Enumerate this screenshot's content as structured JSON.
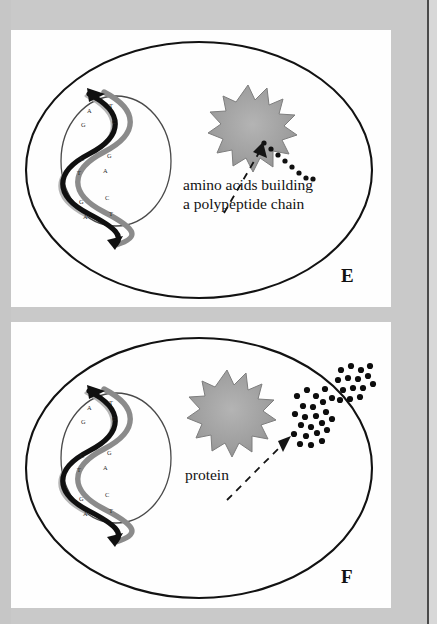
{
  "figure": {
    "background_color": "#c9c9c9",
    "panel_background": "#fefefe",
    "ink_color": "#111111",
    "ribosome_color": "#9a9a9a",
    "page_edge_color": "#4a4a4a"
  },
  "panels": [
    {
      "id": "E",
      "letter": "E",
      "caption_line1": "amino acids building",
      "caption_line2": "a polypeptide chain",
      "cell": {
        "label": "cell membrane"
      },
      "nucleus": {
        "label": "nucleus"
      },
      "dna": {
        "label": "DNA double helix",
        "base_pairs": [
          {
            "left": "A",
            "right": "T"
          },
          {
            "left": "G",
            "right": "C"
          },
          {
            "left": "C",
            "right": "G"
          },
          {
            "left": "T",
            "right": "A"
          },
          {
            "left": "G",
            "right": "C"
          },
          {
            "left": "A",
            "right": "T"
          }
        ]
      },
      "ribosome": {
        "label": "ribosome"
      },
      "amino_acid_chain": {
        "label": "amino acid bead chain",
        "bead_count": 9
      },
      "pointer": {
        "label": "dashed pointer arrow"
      }
    },
    {
      "id": "F",
      "letter": "F",
      "caption_line1": "protein",
      "caption_line2": "",
      "cell": {
        "label": "cell membrane"
      },
      "nucleus": {
        "label": "nucleus"
      },
      "dna": {
        "label": "DNA double helix",
        "base_pairs": [
          {
            "left": "A",
            "right": "T"
          },
          {
            "left": "G",
            "right": "C"
          },
          {
            "left": "C",
            "right": "G"
          },
          {
            "left": "T",
            "right": "A"
          },
          {
            "left": "G",
            "right": "C"
          },
          {
            "left": "A",
            "right": "T"
          }
        ]
      },
      "ribosome": {
        "label": "ribosome"
      },
      "protein_clusters": {
        "label": "folded protein dot clusters",
        "cluster_count": 2
      },
      "pointer": {
        "label": "dashed pointer arrow"
      }
    }
  ]
}
